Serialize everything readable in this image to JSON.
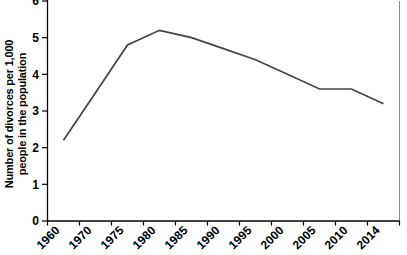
{
  "chart_data": {
    "type": "line",
    "title": "",
    "xlabel": "",
    "ylabel": "Number of divorces per 1,000 people in the population",
    "ylabel_lines": [
      "Number of divorces per 1,000",
      "people in the population"
    ],
    "categories": [
      "1960",
      "1970",
      "1975",
      "1980",
      "1985",
      "1990",
      "1995",
      "2000",
      "2005",
      "2010",
      "2014"
    ],
    "series": [
      {
        "name": "Divorces per 1,000 people in the population",
        "values": [
          2.2,
          3.5,
          4.8,
          5.2,
          5.0,
          4.7,
          4.4,
          4.0,
          3.6,
          3.6,
          3.2
        ]
      }
    ],
    "ylim": [
      0,
      6
    ],
    "y_ticks": [
      0,
      1,
      2,
      3,
      4,
      5,
      6
    ],
    "grid": false,
    "legend": "none",
    "x_tick_label_rotation_deg": -45,
    "colors": {
      "line": "#444444",
      "axis": "#000000",
      "text": "#000000",
      "plot_border": "#8c8c8c",
      "background": "#ffffff"
    }
  }
}
